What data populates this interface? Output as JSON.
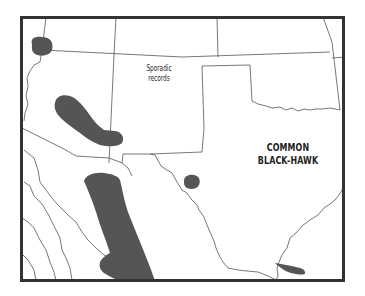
{
  "map": {
    "species_label_line1": "COMMON",
    "species_label_line2": "BLACK-HAWK",
    "annotation_line1": "Sporadic",
    "annotation_line2": "records",
    "colors": {
      "range_fill": "#555555",
      "border_line": "#444444",
      "frame": "#333333",
      "background": "#ffffff"
    },
    "ranges": [
      {
        "name": "range-nevada-utah-spot"
      },
      {
        "name": "range-arizona-central"
      },
      {
        "name": "range-texas-trans-pecos-spot"
      },
      {
        "name": "range-mexico-sierra-madre"
      },
      {
        "name": "range-mexico-sinaloa"
      },
      {
        "name": "range-texas-rio-grande-valley"
      }
    ]
  }
}
